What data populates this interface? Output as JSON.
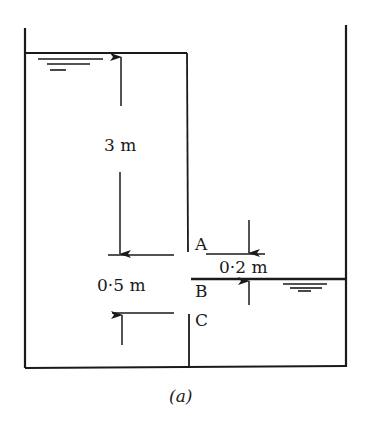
{
  "figure": {
    "caption": "(a)",
    "labels": {
      "point_a": "A",
      "point_b": "B",
      "point_c": "C"
    },
    "dimensions": {
      "head_left": "3 m",
      "gap_height": "0·5 m",
      "a_to_b": "0·2 m"
    },
    "colors": {
      "ink": "#1a1a1a",
      "background": "#ffffff"
    }
  }
}
